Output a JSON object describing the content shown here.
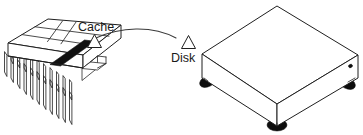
{
  "diagram": {
    "background_color": "#ffffff",
    "line_color": "#1f1f1f",
    "labels": {
      "cache": "Cache",
      "disk": "Disk"
    },
    "components": [
      {
        "id": "cache-chip",
        "label": "Cache",
        "kind": "dip-memory-chip",
        "pin_count_front": 11,
        "pin_count_back": 11,
        "has_black_stripe": true
      },
      {
        "id": "disk-drive",
        "label": "Disk",
        "kind": "external-disk-drive-box",
        "foot_count": 3,
        "has_led": true
      }
    ],
    "connector": {
      "kind": "curved-arc",
      "from": "cache",
      "to": "disk",
      "endpoint_markers": "triangle"
    }
  }
}
